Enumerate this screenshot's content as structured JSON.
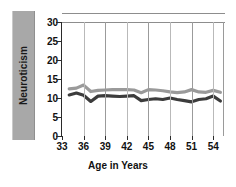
{
  "chart_data": {
    "type": "line",
    "title": "",
    "xlabel": "Age in Years",
    "ylabel": "Neuroticism",
    "xlim": [
      33,
      55.5
    ],
    "ylim": [
      0,
      30
    ],
    "xticks": [
      33,
      36,
      39,
      42,
      45,
      48,
      51,
      54
    ],
    "yticks": [
      0,
      5,
      10,
      15,
      20,
      25,
      30
    ],
    "grid": "vertical",
    "legend": "none",
    "x": [
      34,
      35,
      36,
      37,
      38,
      39,
      40,
      41,
      42,
      43,
      44,
      45,
      46,
      47,
      48,
      49,
      50,
      51,
      52,
      53,
      54,
      55
    ],
    "series": [
      {
        "name": "upper",
        "color": "#9a9a9a",
        "values": [
          12.4,
          12.6,
          13.4,
          11.7,
          12.0,
          12.1,
          12.2,
          12.2,
          12.2,
          12.1,
          11.4,
          12.2,
          12.1,
          11.9,
          11.6,
          11.4,
          11.6,
          12.2,
          11.6,
          11.5,
          12.0,
          11.5
        ]
      },
      {
        "name": "lower",
        "color": "#3c3c3c",
        "values": [
          10.8,
          11.3,
          10.7,
          9.1,
          10.5,
          10.6,
          10.5,
          10.4,
          10.5,
          10.6,
          9.3,
          9.6,
          9.8,
          9.6,
          10.0,
          9.6,
          9.3,
          9.0,
          9.6,
          9.8,
          10.5,
          9.2
        ]
      }
    ]
  },
  "axis": {
    "ylabel_text": "Neuroticism",
    "xlabel_text": "Age in Years",
    "ytick_labels": [
      "30",
      "25",
      "20",
      "15",
      "10",
      "5",
      "0"
    ],
    "xtick_labels": [
      "33",
      "36",
      "39",
      "42",
      "45",
      "48",
      "51",
      "54"
    ]
  },
  "colors": {
    "label_box": "#a8a8a8",
    "upper_line": "#9a9a9a",
    "lower_line": "#3c3c3c",
    "axis": "#2a2a2a",
    "grid": "#9b9b9b",
    "background": "#ffffff"
  }
}
